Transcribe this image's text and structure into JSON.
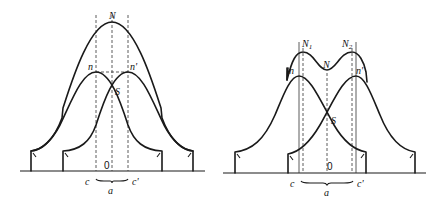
{
  "figure": {
    "left_panel": {
      "labels": {
        "N": "N",
        "n": "n",
        "n_prime": "n'",
        "S": "S",
        "origin": "0",
        "c": "c",
        "c_prime": "c'",
        "a": "a"
      },
      "description": "Two overlapping bell curves (n, n') whose sum N forms a single peak; separation a between c and c'"
    },
    "right_panel": {
      "labels": {
        "N1": "N",
        "N1_sub": "1",
        "N2": "N",
        "N2_sub": "2",
        "N": "N",
        "n": "n",
        "n_prime": "n'",
        "S": "S",
        "origin": "0",
        "c": "c",
        "c_prime": "c'",
        "a": "a"
      },
      "description": "Two overlapping bell curves (n, n') more widely separated; sum N shows two peaks N1, N2 with a dip at N"
    }
  }
}
